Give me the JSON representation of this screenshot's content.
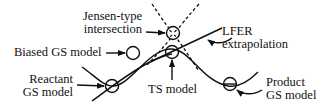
{
  "diagram": {
    "title": "",
    "colors": {
      "stroke": "#111111",
      "background": "#ffffff"
    },
    "labels": {
      "jensen": {
        "line1": "Jensen-type",
        "line2": "intersection"
      },
      "biased": "Biased GS model",
      "reactant": {
        "line1": "Reactant",
        "line2": "GS model"
      },
      "ts": "TS model",
      "lfer": {
        "line1": "LFER",
        "line2": "extrapolation"
      },
      "product": {
        "line1": "Product",
        "line2": "GS model"
      }
    },
    "elements": [
      {
        "id": "reactant-gs-circle",
        "kind": "circle",
        "desc": "reactant ground-state model on energy curve minimum"
      },
      {
        "id": "biased-gs-circle",
        "kind": "circle",
        "desc": "biased ground-state model, off-curve"
      },
      {
        "id": "ts-circle",
        "kind": "circle",
        "desc": "transition-state model at curve maximum"
      },
      {
        "id": "jensen-circle",
        "kind": "circle-with-x",
        "desc": "Jensen-type intersection of dashed extrapolated curves"
      },
      {
        "id": "product-gs-circle",
        "kind": "circle-with-line",
        "desc": "product ground-state model at second minimum"
      },
      {
        "id": "lfer-line",
        "kind": "line",
        "desc": "linear free-energy relationship extrapolation"
      },
      {
        "id": "energy-curve",
        "kind": "curve",
        "desc": "reaction energy profile"
      },
      {
        "id": "dashed-parabolas",
        "kind": "dashed-curves",
        "desc": "extrapolated reactant/product parabolas crossing"
      }
    ]
  }
}
